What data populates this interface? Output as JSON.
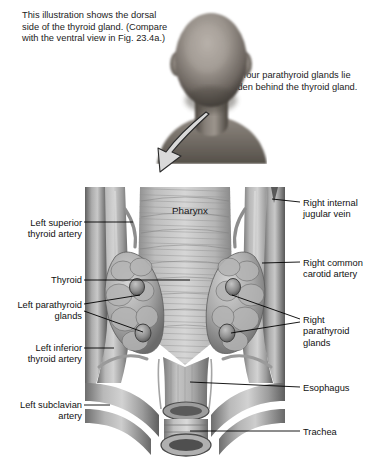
{
  "figure": {
    "captions": {
      "left": "This illustration shows the dorsal side of the thyroid gland. (Compare with the ventral view in Fig. 23.4a.)",
      "right": "The four parathyroid glands lie hidden behind the thyroid gland."
    },
    "photo": {
      "name": "posterior-head-and-neck-photograph",
      "description": "Black and white photograph of the back of a person's head and neck"
    },
    "arrow": {
      "name": "pointer-arrow",
      "description": "Curved arrow from the back of the neck pointing down and to the left toward the illustration"
    }
  },
  "illustration": {
    "center_label": "Pharynx",
    "left_labels": [
      {
        "id": "left-superior-thyroid-artery",
        "text": "Left superior thyroid artery"
      },
      {
        "id": "thyroid",
        "text": "Thyroid"
      },
      {
        "id": "left-parathyroid-glands",
        "text": "Left parathyroid glands"
      },
      {
        "id": "left-inferior-thyroid-artery",
        "text": "Left inferior thyroid artery"
      },
      {
        "id": "left-subclavian-artery",
        "text": "Left subclavian artery"
      }
    ],
    "right_labels": [
      {
        "id": "right-internal-jugular-vein",
        "text": "Right internal jugular vein"
      },
      {
        "id": "right-common-carotid-artery",
        "text": "Right common carotid artery"
      },
      {
        "id": "right-parathyroid-glands",
        "text": "Right parathyroid glands"
      },
      {
        "id": "esophagus",
        "text": "Esophagus"
      },
      {
        "id": "trachea",
        "text": "Trachea"
      }
    ],
    "structures": [
      "pharynx",
      "thyroid-gland-left-lobe",
      "thyroid-gland-right-lobe",
      "parathyroid-gland",
      "esophagus",
      "trachea",
      "common-carotid-artery",
      "internal-jugular-vein",
      "superior-thyroid-artery",
      "inferior-thyroid-artery",
      "subclavian-artery"
    ]
  },
  "colors": {
    "background": "#ffffff",
    "text": "#111111",
    "leader_line": "#000000",
    "tissue_light": "#c9c9c9",
    "tissue_mid": "#9a9a9a",
    "tissue_dark": "#6e6e6e",
    "tissue_shadow": "#4a4a4a",
    "arrow_fill": "#d8d8d8"
  }
}
